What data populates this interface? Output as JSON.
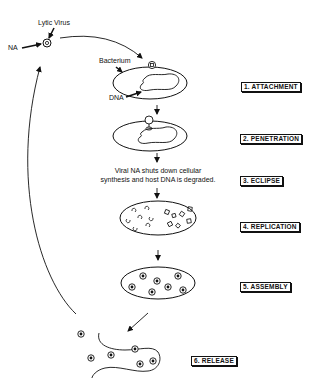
{
  "diagram": {
    "type": "lytic-cycle",
    "labels": {
      "lytic_virus": "Lytic Virus",
      "na": "NA",
      "bacterium": "Bacterium",
      "dna": "DNA"
    },
    "steps": [
      {
        "number": 1,
        "label": "1. ATTACHMENT"
      },
      {
        "number": 2,
        "label": "2. PENETRATION"
      },
      {
        "number": 3,
        "label": "3. ECLIPSE"
      },
      {
        "number": 4,
        "label": "4. REPLICATION"
      },
      {
        "number": 5,
        "label": "5. ASSEMBLY"
      },
      {
        "number": 6,
        "label": "6. RELEASE"
      }
    ],
    "eclipse_note_line1": "Viral NA shuts down cellular",
    "eclipse_note_line2": "synthesis and host DNA is degraded.",
    "colors": {
      "ink": "#111111",
      "background": "#ffffff"
    }
  }
}
